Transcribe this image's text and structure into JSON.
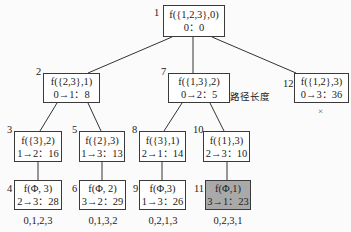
{
  "nodes": {
    "n1": {
      "index": "1",
      "fn": "f({1,2,3},0)",
      "path": "0：0"
    },
    "n2": {
      "index": "2",
      "fn": "f({2,3},1)",
      "path": "0→1：8"
    },
    "n7": {
      "index": "7",
      "fn": "f({1,3},2)",
      "path": "0→2：5"
    },
    "n12": {
      "index": "12",
      "fn": "f({1,2},3)",
      "path": "0→3：36"
    },
    "n3": {
      "index": "3",
      "fn": "f({3},2)",
      "path": "1→2：16"
    },
    "n5": {
      "index": "5",
      "fn": "f({2},3)",
      "path": "1→3：13"
    },
    "n8": {
      "index": "8",
      "fn": "f({3},1)",
      "path": "2→1：14"
    },
    "n10": {
      "index": "10",
      "fn": "f({1},3)",
      "path": "2→3：10"
    },
    "n4": {
      "index": "4",
      "fn": "f(Φ, 3)",
      "path": "2→3：28",
      "sequence": "0,1,2,3"
    },
    "n6": {
      "index": "6",
      "fn": "f(Φ, 2)",
      "path": "3→2：29",
      "sequence": "0,1,3,2"
    },
    "n9": {
      "index": "9",
      "fn": "f(Φ,3)",
      "path": "1→3：26",
      "sequence": "0,2,1,3"
    },
    "n11": {
      "index": "11",
      "fn": "f(Φ,1)",
      "path": "3→1：23",
      "sequence": "0,2,3,1",
      "highlighted": true
    }
  },
  "annotation": {
    "label": "路径长度",
    "arrow": "left-arrow"
  },
  "pruned_marker": "×",
  "colors": {
    "highlight_fill": "#a9a9a9",
    "border": "#3a3a3a",
    "edge": "#333333"
  }
}
